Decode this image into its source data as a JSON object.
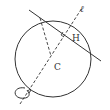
{
  "diagram": {
    "type": "sphere-rotation-axis",
    "labels": {
      "axis": "ℓ",
      "foot": "H",
      "center": "C"
    },
    "colors": {
      "stroke": "#333333",
      "background": "#ffffff"
    },
    "elements": [
      {
        "name": "circle",
        "kind": "circle",
        "style": "solid"
      },
      {
        "name": "secant-line",
        "kind": "line",
        "style": "solid"
      },
      {
        "name": "axis-l",
        "kind": "line",
        "style": "dashed"
      },
      {
        "name": "radius-segment",
        "kind": "segment",
        "style": "dashed",
        "from": "point-on-circle",
        "to": "C"
      },
      {
        "name": "perpendicular-mark",
        "kind": "right-angle",
        "at": "H"
      },
      {
        "name": "rotation-arrow",
        "kind": "arrow-loop",
        "around": "axis-l"
      }
    ]
  }
}
